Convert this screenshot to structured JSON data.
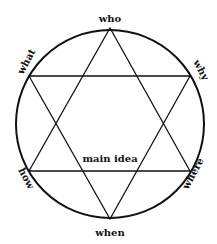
{
  "diagram": {
    "type": "hexagram-in-circle",
    "colors": {
      "stroke": "#111111",
      "background": "#ffffff"
    },
    "labels": {
      "top": "who",
      "upper_left": "what",
      "upper_right": "why",
      "lower_left": "how",
      "lower_right": "where",
      "bottom": "when",
      "center": "main idea"
    }
  }
}
